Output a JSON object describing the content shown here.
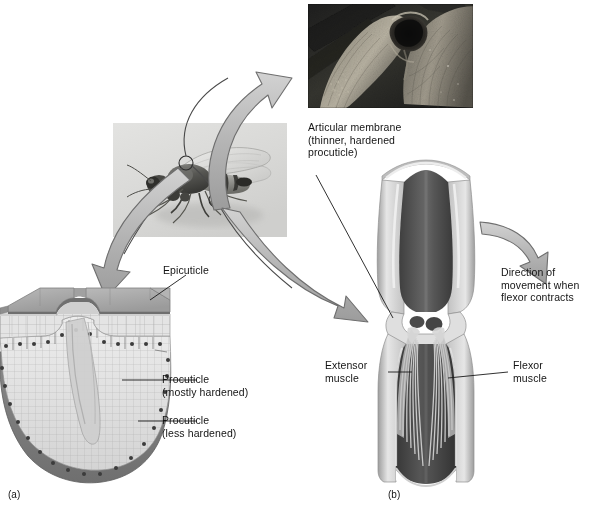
{
  "figure": {
    "domain": "biology-illustration",
    "panels": [
      {
        "id": "a",
        "label": "(a)",
        "caption_x": 26,
        "caption_y": 489
      },
      {
        "id": "b",
        "label": "(b)",
        "caption_x": 392,
        "caption_y": 489
      }
    ]
  },
  "labels": {
    "epicuticle": "Epicuticle",
    "procuticle_mostly": "Procuticle\n(mostly hardened)",
    "procuticle_less": "Procuticle\n(less hardened)",
    "articular_membrane": "Articular membrane\n(thinner, hardened\nprocuticle)",
    "direction_of_movement": "Direction of\nmovement when\nflexor contracts",
    "extensor_muscle": "Extensor\nmuscle",
    "flexor_muscle": "Flexor\nmuscle"
  },
  "images": {
    "sem_micrograph": {
      "name": "sem-leg-joint-micrograph",
      "description": "Scanning electron micrograph of an insect leg joint"
    },
    "insect_photo": {
      "name": "insect-specimen-photo",
      "description": "Photograph of a winged insect with two circled regions"
    }
  },
  "callout_circles": [
    {
      "name": "thorax-callout-circle",
      "cx": 186,
      "cy": 163,
      "r": 7
    },
    {
      "name": "leg-joint-callout-circle",
      "cx": 216,
      "cy": 200,
      "r": 7
    }
  ],
  "arrows": [
    {
      "name": "arrow-to-sem-photo",
      "from": "leg-joint-callout-circle",
      "to": "sem-micrograph"
    },
    {
      "name": "arrow-to-cuticle-block",
      "from": "thorax-callout-circle",
      "to": "cuticle-block-diagram"
    },
    {
      "name": "arrow-to-leg-joint-diagram",
      "from": "leg-joint-callout-circle",
      "to": "leg-joint-diagram"
    },
    {
      "name": "arrow-direction-of-movement",
      "from": "leg-joint-diagram",
      "to": "direction-of-movement-label"
    }
  ],
  "colors": {
    "background": "#ffffff",
    "cuticle_top": "#9a9a9a",
    "cuticle_top_light": "#b4b4b4",
    "procuticle_light": "#dedede",
    "procuticle_grid": "#9d9d9d",
    "epidermis": "#7b7b7b",
    "epidermis_nucleus": "#3c3c3c",
    "arrow_fill": "#b8b8b8",
    "arrow_stroke": "#6e6e6e",
    "leg_wall_light": "#e2e2e2",
    "leg_wall_mid": "#a8a8a8",
    "leg_lumen_dark": "#4a4a4a",
    "leg_lumen_darker": "#3a3a3a",
    "muscle_fiber": "#c9c9c9",
    "condyle": "#4b4b4b",
    "leader_line": "#1a1a1a",
    "text": "#141414"
  },
  "structures": {
    "panel_a": [
      "epicuticle outer slab",
      "procuticle mostly hardened layer",
      "procuticle less hardened layer",
      "apodeme invagination",
      "epidermal cell layer with nuclei"
    ],
    "panel_b": [
      "leg segment tube",
      "articular membrane at joint",
      "condyle pivot",
      "extensor muscle fibers",
      "flexor muscle fibers"
    ]
  }
}
